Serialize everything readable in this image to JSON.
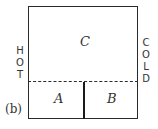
{
  "figure": {
    "panel_label": "(b)",
    "left_side_label": [
      "H",
      "O",
      "T"
    ],
    "right_side_label": [
      "C",
      "O",
      "L",
      "D"
    ],
    "regions": {
      "top": "C",
      "bottom_left": "A",
      "bottom_right": "B"
    },
    "line_color": "#2a2a2a"
  }
}
